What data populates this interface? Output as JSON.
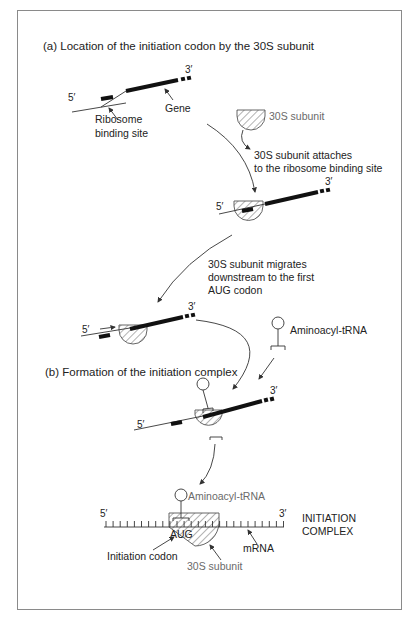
{
  "figure": {
    "section_a_title": "(a) Location of the initiation codon by the 30S subunit",
    "section_b_title": "(b) Formation of the initiation complex",
    "step1": {
      "five_prime": "5′",
      "three_prime": "3′",
      "gene_label": "Gene",
      "rbs_label_line1": "Ribosome",
      "rbs_label_line2": "binding site",
      "subunit_label": "30S subunit"
    },
    "step2": {
      "caption_line1": "30S subunit attaches",
      "caption_line2": "to the ribosome binding site",
      "five_prime": "5′",
      "three_prime": "3′"
    },
    "step3": {
      "caption_line1": "30S subunit migrates",
      "caption_line2": "downstream to the first",
      "caption_line3": "AUG codon",
      "five_prime": "5′",
      "three_prime": "3′",
      "trna_label": "Aminoacyl-tRNA"
    },
    "step4": {
      "five_prime": "5′",
      "three_prime": "3′"
    },
    "complex": {
      "five_prime": "5′",
      "three_prime": "3′",
      "trna_label": "Aminoacyl-tRNA",
      "codon_text": "AUG",
      "initiation_codon_label": "Initiation codon",
      "subunit_label": "30S subunit",
      "mrna_label": "mRNA",
      "complex_label_line1": "INITIATION",
      "complex_label_line2": "COMPLEX"
    }
  }
}
